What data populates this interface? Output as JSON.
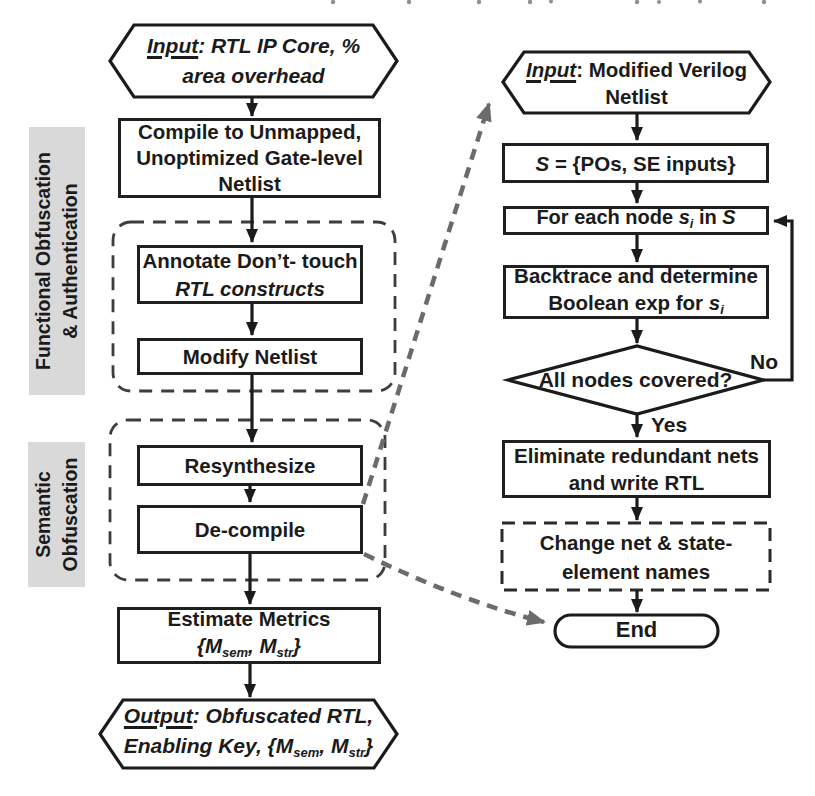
{
  "colors": {
    "ink": "#1b1b1b",
    "box_border": "#1f1f1f",
    "dashed_container": "#3d3d3d",
    "callout_gray": "#6b6b6b",
    "label_bg": "#d9d9d9",
    "background": "#ffffff"
  },
  "left_flow": {
    "section_labels": [
      {
        "lines": [
          "Functional Obfuscation",
          "& Authentication"
        ]
      },
      {
        "lines": [
          "Semantic",
          "Obfuscation"
        ]
      }
    ],
    "input": {
      "keyword": "Input",
      "after": ": RTL IP Core, %",
      "line2": "area overhead"
    },
    "compile": {
      "lines": [
        "Compile to Unmapped,",
        "Unoptimized Gate-level",
        "Netlist"
      ]
    },
    "annotate": {
      "line1": "Annotate Don’t- touch",
      "line2": "RTL constructs"
    },
    "modify": "Modify Netlist",
    "resynthesize": "Resynthesize",
    "decompile": "De-compile",
    "estimate": {
      "line1": "Estimate Metrics",
      "metrics": {
        "open": "{M",
        "sub1": "sem",
        "mid": ", M",
        "sub2": "str",
        "close": "}"
      }
    },
    "output": {
      "keyword": "Output",
      "after": ": Obfuscated RTL,",
      "line2_pre": "Enabling Key, {M",
      "sub1": "sem",
      "mid": ", M",
      "sub2": "str",
      "close": "}"
    }
  },
  "right_flow": {
    "input": {
      "keyword": "Input",
      "after": ": Modified Verilog",
      "line2": "Netlist"
    },
    "assign_s": {
      "s": "S",
      "rest": " = {POs, SE inputs}"
    },
    "foreach": {
      "pre": "For each node ",
      "s": "s",
      "sub": "i",
      "mid": " in ",
      "set": "S"
    },
    "backtrace": {
      "line1": "Backtrace and determine",
      "line2_pre": "Boolean exp for ",
      "s": "s",
      "sub": "i"
    },
    "decision": "All nodes covered?",
    "eliminate": {
      "lines": [
        "Eliminate redundant nets",
        "and write RTL"
      ]
    },
    "rename": {
      "lines": [
        "Change net & state-",
        "element names"
      ]
    },
    "end": "End",
    "edge_labels": {
      "no": "No",
      "yes": "Yes"
    }
  }
}
